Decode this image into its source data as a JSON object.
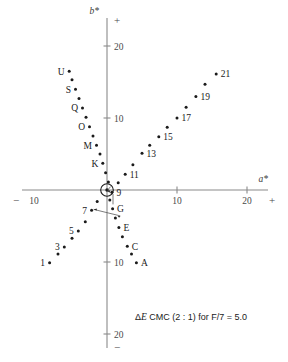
{
  "chart_data": {
    "type": "scatter",
    "title": "",
    "xlabel": "a*",
    "ylabel": "b*",
    "xlim": [
      -11,
      24
    ],
    "ylim": [
      -22,
      23
    ],
    "grid": false,
    "legend": null,
    "axis_signs": {
      "x_negative": "−",
      "x_positive": "+",
      "y_positive": "+",
      "y_negative": "−"
    },
    "xticks": [
      {
        "value": -10,
        "label": "10"
      },
      {
        "value": 10,
        "label": "10"
      },
      {
        "value": 20,
        "label": "20"
      }
    ],
    "yticks": [
      {
        "value": 20,
        "label": "20"
      },
      {
        "value": 10,
        "label": "10"
      },
      {
        "value": -10,
        "label": "10"
      },
      {
        "value": -20,
        "label": "20"
      }
    ],
    "center_marker": {
      "label": "",
      "a": 0.0,
      "b": 0.0,
      "ring_radius_units": 0.9,
      "note": "standard reference sample circled at origin"
    },
    "annotation": "ΔE CMC (2 : 1)  for F/7 = 5.0",
    "annotation_parts": {
      "delta": "Δ",
      "e_italic": "E",
      "rest": " CMC (2 : 1)  for F/7 = 5.0"
    },
    "points": [
      {
        "id": "p1",
        "label": "1",
        "a": -8.2,
        "b": -10.1
      },
      {
        "id": "p2",
        "label": "",
        "a": -7.0,
        "b": -8.9
      },
      {
        "id": "p3",
        "label": "3",
        "a": -6.1,
        "b": -7.9
      },
      {
        "id": "p4",
        "label": "",
        "a": -5.0,
        "b": -6.7
      },
      {
        "id": "p5",
        "label": "5",
        "a": -4.1,
        "b": -5.7
      },
      {
        "id": "p6",
        "label": "",
        "a": -3.1,
        "b": -4.4
      },
      {
        "id": "p7",
        "label": "7",
        "a": -2.2,
        "b": -2.8
      },
      {
        "id": "p8",
        "label": "",
        "a": -1.4,
        "b": -1.6
      },
      {
        "id": "p9",
        "label": "9",
        "a": 0.7,
        "b": -0.3
      },
      {
        "id": "p10",
        "label": "",
        "a": 1.6,
        "b": 1.0
      },
      {
        "id": "p11",
        "label": "11",
        "a": 2.6,
        "b": 2.2
      },
      {
        "id": "p12",
        "label": "",
        "a": 3.7,
        "b": 3.5
      },
      {
        "id": "p13",
        "label": "13",
        "a": 5.0,
        "b": 5.1
      },
      {
        "id": "p14",
        "label": "",
        "a": 6.1,
        "b": 6.2
      },
      {
        "id": "p15",
        "label": "15",
        "a": 7.4,
        "b": 7.4
      },
      {
        "id": "p16",
        "label": "",
        "a": 8.6,
        "b": 8.7
      },
      {
        "id": "p17",
        "label": "17",
        "a": 10.0,
        "b": 10.0
      },
      {
        "id": "p18",
        "label": "",
        "a": 11.3,
        "b": 11.5
      },
      {
        "id": "p19",
        "label": "19",
        "a": 12.7,
        "b": 13.0
      },
      {
        "id": "p20",
        "label": "",
        "a": 14.0,
        "b": 14.7
      },
      {
        "id": "p21",
        "label": "21",
        "a": 15.6,
        "b": 16.1
      },
      {
        "id": "pA",
        "label": "A",
        "a": 4.2,
        "b": -10.1
      },
      {
        "id": "pB",
        "label": "",
        "a": 3.5,
        "b": -8.9
      },
      {
        "id": "pC",
        "label": "C",
        "a": 2.9,
        "b": -7.8
      },
      {
        "id": "pD",
        "label": "",
        "a": 2.2,
        "b": -6.5
      },
      {
        "id": "pE",
        "label": "E",
        "a": 1.7,
        "b": -5.2
      },
      {
        "id": "pF",
        "label": "",
        "a": 1.2,
        "b": -3.9
      },
      {
        "id": "pG",
        "label": "G",
        "a": 0.8,
        "b": -2.6
      },
      {
        "id": "pH",
        "label": "",
        "a": 0.4,
        "b": -1.4
      },
      {
        "id": "pI",
        "label": "",
        "a": 0.2,
        "b": 1.1
      },
      {
        "id": "pJ",
        "label": "",
        "a": -0.2,
        "b": 2.4
      },
      {
        "id": "pK",
        "label": "K",
        "a": -0.6,
        "b": 3.7
      },
      {
        "id": "pL",
        "label": "",
        "a": -1.0,
        "b": 5.0
      },
      {
        "id": "pM",
        "label": "M",
        "a": -1.5,
        "b": 6.2
      },
      {
        "id": "pN",
        "label": "",
        "a": -2.0,
        "b": 7.5
      },
      {
        "id": "pO",
        "label": "O",
        "a": -2.5,
        "b": 8.8
      },
      {
        "id": "pP",
        "label": "",
        "a": -3.0,
        "b": 10.1
      },
      {
        "id": "pQ",
        "label": "Q",
        "a": -3.5,
        "b": 11.4
      },
      {
        "id": "pR",
        "label": "",
        "a": -4.0,
        "b": 12.7
      },
      {
        "id": "pS",
        "label": "S",
        "a": -4.5,
        "b": 14.0
      },
      {
        "id": "pT",
        "label": "",
        "a": -5.0,
        "b": 15.3
      },
      {
        "id": "pU",
        "label": "U",
        "a": -5.4,
        "b": 16.5
      }
    ]
  }
}
